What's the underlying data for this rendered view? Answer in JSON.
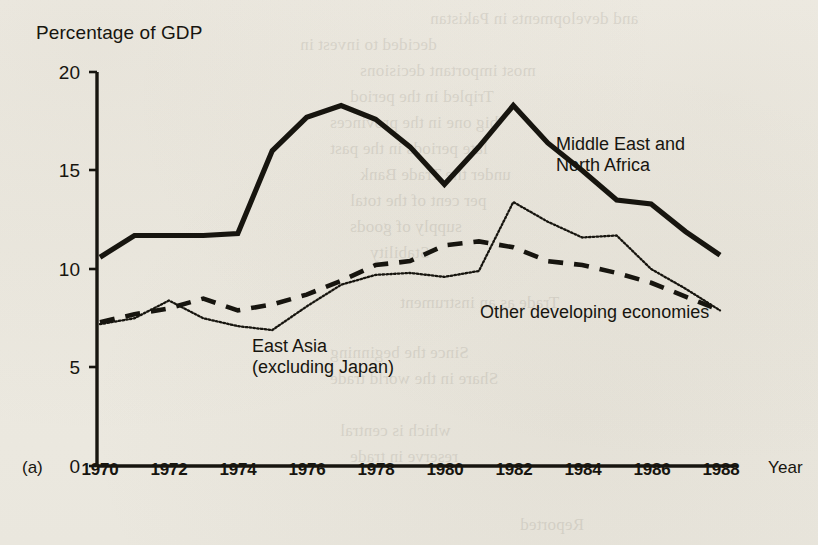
{
  "figure": {
    "panel_label": "(a)",
    "y_axis_title": "Percentage of GDP",
    "x_axis_title": "Year",
    "background_color": "#efece4",
    "ink_color": "#17150f"
  },
  "series_labels": {
    "mena_line1": "Middle East and",
    "mena_line2": "North Africa",
    "east_asia_line1": "East Asia",
    "east_asia_line2": "(excluding Japan)",
    "other": "Other developing economies"
  },
  "y_ticks": [
    "0",
    "5",
    "10",
    "15",
    "20"
  ],
  "x_ticks": [
    "1970",
    "1972",
    "1974",
    "1976",
    "1978",
    "1980",
    "1982",
    "1984",
    "1986",
    "1988"
  ],
  "chart_data": {
    "type": "line",
    "title": "",
    "xlabel": "Year",
    "ylabel": "Percentage of GDP",
    "xlim": [
      1970,
      1988
    ],
    "ylim": [
      0,
      20
    ],
    "yticks": [
      0,
      5,
      10,
      15,
      20
    ],
    "xticks": [
      1970,
      1972,
      1974,
      1976,
      1978,
      1980,
      1982,
      1984,
      1986,
      1988
    ],
    "grid": false,
    "legend": "inline-annotations",
    "x": [
      1970,
      1971,
      1972,
      1973,
      1974,
      1975,
      1976,
      1977,
      1978,
      1979,
      1980,
      1981,
      1982,
      1983,
      1984,
      1985,
      1986,
      1987,
      1988
    ],
    "series": [
      {
        "name": "Middle East and North Africa",
        "style": "solid-thick",
        "color": "#17150f",
        "values": [
          10.6,
          11.7,
          11.7,
          11.7,
          11.8,
          16.0,
          17.7,
          18.3,
          17.6,
          16.2,
          14.3,
          16.2,
          18.3,
          16.4,
          15.0,
          13.5,
          13.3,
          11.9,
          10.7
        ]
      },
      {
        "name": "Other developing economies",
        "style": "dashed",
        "color": "#17150f",
        "values": [
          7.3,
          7.7,
          8.0,
          8.5,
          7.9,
          8.2,
          8.7,
          9.4,
          10.2,
          10.4,
          11.2,
          11.4,
          11.1,
          10.4,
          10.2,
          9.8,
          9.3,
          8.6,
          7.9
        ]
      },
      {
        "name": "East Asia (excluding Japan)",
        "style": "dotted",
        "color": "#17150f",
        "values": [
          7.2,
          7.5,
          8.4,
          7.5,
          7.1,
          6.9,
          8.1,
          9.2,
          9.7,
          9.8,
          9.6,
          9.9,
          13.4,
          12.4,
          11.6,
          11.7,
          10.0,
          9.0,
          7.9
        ]
      }
    ]
  }
}
